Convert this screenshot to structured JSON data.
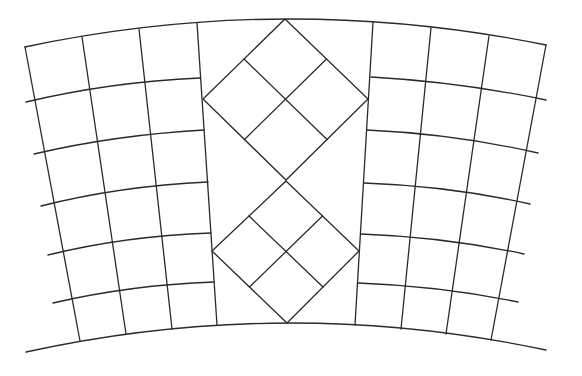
{
  "diagram": {
    "title": "",
    "stroke_color": "#2a2a2a",
    "background": "#ffffff",
    "outer_top_arc": {
      "start": [
        25,
        47
      ],
      "control": [
        285,
        -8
      ],
      "end": [
        546,
        45
      ]
    },
    "outer_bottom_arc": {
      "start": [
        26,
        352
      ],
      "control": [
        286,
        295
      ],
      "end": [
        546,
        350
      ]
    },
    "left_panel": {
      "verticals": [
        {
          "top": [
            25,
            47
          ],
          "bottom": [
            80,
            341
          ]
        },
        {
          "top": [
            82,
            37
          ],
          "bottom": [
            126,
            334
          ]
        },
        {
          "top": [
            139,
            29
          ],
          "bottom": [
            172,
            329
          ]
        },
        {
          "top": [
            197,
            23
          ],
          "bottom": [
            217,
            325
          ]
        }
      ],
      "horizontals": [
        {
          "start": [
            26,
            102
          ],
          "control": [
            110,
            82
          ],
          "end": [
            200,
            78
          ]
        },
        {
          "start": [
            34,
            154
          ],
          "control": [
            115,
            135
          ],
          "end": [
            204,
            130
          ]
        },
        {
          "start": [
            41,
            206
          ],
          "control": [
            120,
            186
          ],
          "end": [
            208,
            182
          ]
        },
        {
          "start": [
            48,
            255
          ],
          "control": [
            125,
            236
          ],
          "end": [
            211,
            233
          ]
        },
        {
          "start": [
            53,
            303
          ],
          "control": [
            130,
            285
          ],
          "end": [
            214,
            282
          ]
        }
      ]
    },
    "right_panel": {
      "verticals": [
        {
          "top": [
            373,
            22
          ],
          "bottom": [
            355,
            325
          ]
        },
        {
          "top": [
            431,
            28
          ],
          "bottom": [
            401,
            329
          ]
        },
        {
          "top": [
            489,
            36
          ],
          "bottom": [
            446,
            334
          ]
        },
        {
          "top": [
            546,
            45
          ],
          "bottom": [
            491,
            340
          ]
        }
      ],
      "horizontals": [
        {
          "start": [
            371,
            77
          ],
          "control": [
            460,
            82
          ],
          "end": [
            546,
            100
          ]
        },
        {
          "start": [
            367,
            130
          ],
          "control": [
            455,
            134
          ],
          "end": [
            538,
            153
          ]
        },
        {
          "start": [
            364,
            183
          ],
          "control": [
            450,
            186
          ],
          "end": [
            530,
            204
          ]
        },
        {
          "start": [
            361,
            234
          ],
          "control": [
            445,
            237
          ],
          "end": [
            524,
            254
          ]
        },
        {
          "start": [
            358,
            283
          ],
          "control": [
            440,
            286
          ],
          "end": [
            518,
            302
          ]
        }
      ]
    },
    "diamonds": [
      {
        "name": "upper",
        "top": [
          285,
          19
        ],
        "right": [
          368,
          99
        ],
        "bottom": [
          286,
          180
        ],
        "left": [
          203,
          99
        ]
      },
      {
        "name": "lower",
        "top": [
          286,
          181
        ],
        "right": [
          359,
          251
        ],
        "bottom": [
          287,
          323
        ],
        "left": [
          212,
          251
        ]
      }
    ]
  }
}
